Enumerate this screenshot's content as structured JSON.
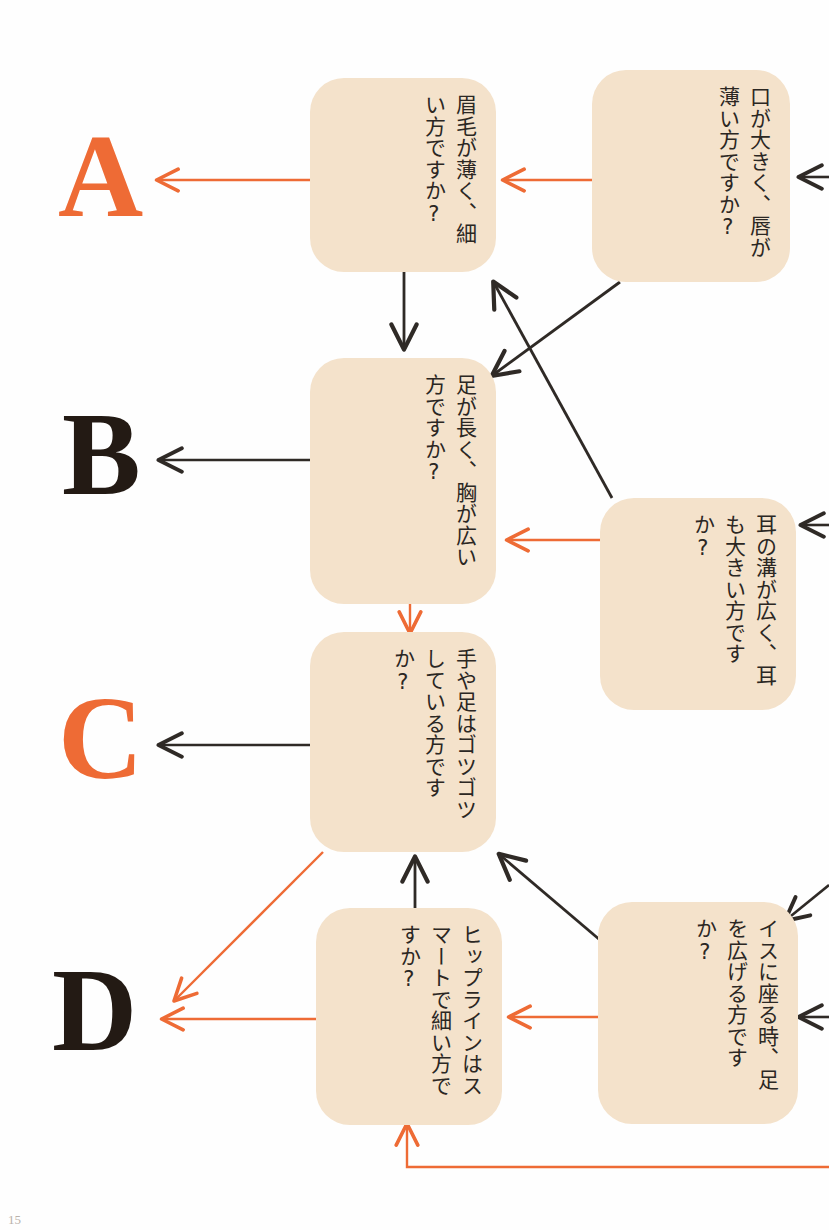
{
  "diagram": {
    "colors": {
      "box_fill": "#f4e2cb",
      "orange": "#ee6b35",
      "dark": "#2f2a26",
      "text": "#2b2723",
      "background": "#fefefe"
    },
    "boxes": [
      {
        "id": "eyebrow",
        "text": "眉毛が薄く、細い方ですか?"
      },
      {
        "id": "mouth",
        "text": "口が大きく、唇が薄い方ですか?"
      },
      {
        "id": "legs_chest",
        "text": "足が長く、胸が広い方ですか?"
      },
      {
        "id": "ears",
        "text": "耳の溝が広く、耳も大きい方ですか?"
      },
      {
        "id": "hands_feet",
        "text": "手や足はゴツゴツしている方ですか?"
      },
      {
        "id": "hips",
        "text": "ヒップラインはスマートで細い方ですか?"
      },
      {
        "id": "chair",
        "text": "イスに座る時、足を広げる方ですか?"
      }
    ],
    "results": [
      {
        "id": "A",
        "label": "A",
        "color": "orange"
      },
      {
        "id": "B",
        "label": "B",
        "color": "dark"
      },
      {
        "id": "C",
        "label": "C",
        "color": "orange"
      },
      {
        "id": "D",
        "label": "D",
        "color": "dark"
      }
    ],
    "page_number": "15"
  }
}
